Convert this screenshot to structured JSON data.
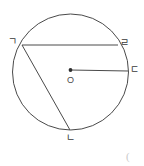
{
  "figure": {
    "type": "circle-geometry-diagram",
    "background_color": "#ffffff",
    "stroke_color": "#4a4a4a",
    "label_color": "#3a3a3a",
    "canvas": {
      "width": 144,
      "height": 166
    }
  },
  "circle": {
    "center_label": "O",
    "center": {
      "x": 70.5,
      "y": 72
    },
    "radius": 58
  },
  "points": [
    {
      "id": "gieuk",
      "label": "ㄱ",
      "x": 22,
      "y": 45,
      "label_x": 8,
      "label_y": 37
    },
    {
      "id": "nieun",
      "label": "ㄴ",
      "x": 70,
      "y": 130,
      "label_x": 66,
      "label_y": 133
    },
    {
      "id": "digeut",
      "label": "ㄷ",
      "x": 128,
      "y": 71,
      "label_x": 130,
      "label_y": 65
    },
    {
      "id": "rieul",
      "label": "ㄹ",
      "x": 118,
      "y": 45,
      "label_x": 120,
      "label_y": 38
    }
  ],
  "segments": [
    {
      "id": "chord-gieuk-rieul",
      "from": "gieuk",
      "to": "rieul",
      "kind": "chord"
    },
    {
      "id": "chord-gieuk-nieun",
      "from": "gieuk",
      "to": "nieun",
      "kind": "chord"
    },
    {
      "id": "radius-o-digeut",
      "from": "center",
      "to": "digeut",
      "kind": "radius"
    }
  ],
  "corner": {
    "mark": "("
  }
}
